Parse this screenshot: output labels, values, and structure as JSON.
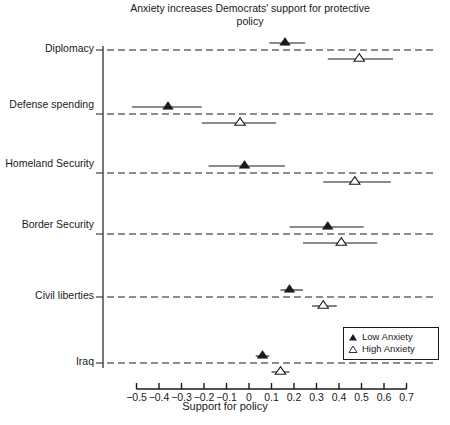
{
  "chart_data": {
    "type": "scatter",
    "title": "Anxiety increases Democrats' support for protective policy",
    "xlabel": "Support for policy",
    "ylabel": "",
    "xlim": [
      -0.55,
      0.72
    ],
    "ylim": [
      0,
      7
    ],
    "grid": "horizontal-dashed-per-category",
    "legend_position": "bottom-right",
    "orientation": "horizontal",
    "categories": [
      "Diplomacy",
      "Defense spending",
      "Homeland Security",
      "Border Security",
      "Civil liberties",
      "Iraq"
    ],
    "xticks": [
      -0.5,
      -0.4,
      -0.3,
      -0.2,
      -0.1,
      0,
      0.1,
      0.2,
      0.3,
      0.4,
      0.5,
      0.6,
      0.7
    ],
    "xtick_labels": [
      "−0.5",
      "−0.4",
      "−0.3",
      "−0.2",
      "−0.1",
      "0",
      "0.1",
      "0.2",
      "0.3",
      "0.4",
      "0.5",
      "0.6",
      "0.7"
    ],
    "series": [
      {
        "name": "Low Anxiety",
        "marker": "filled-triangle",
        "color": "#1a1a1a",
        "values": [
          0.16,
          -0.36,
          -0.02,
          0.35,
          0.18,
          0.06
        ],
        "ci_low": [
          0.09,
          -0.52,
          -0.18,
          0.18,
          0.14,
          0.03
        ],
        "ci_high": [
          0.25,
          -0.21,
          0.16,
          0.51,
          0.24,
          0.09
        ]
      },
      {
        "name": "High Anxiety",
        "marker": "open-triangle",
        "color": "#1a1a1a",
        "values": [
          0.49,
          -0.04,
          0.47,
          0.41,
          0.33,
          0.14
        ],
        "ci_low": [
          0.35,
          -0.21,
          0.33,
          0.24,
          0.28,
          0.1
        ],
        "ci_high": [
          0.64,
          0.12,
          0.63,
          0.57,
          0.39,
          0.18
        ]
      }
    ]
  },
  "legend": {
    "items": [
      {
        "label": "Low Anxiety",
        "marker": "filled-triangle"
      },
      {
        "label": "High Anxiety",
        "marker": "open-triangle"
      }
    ]
  }
}
